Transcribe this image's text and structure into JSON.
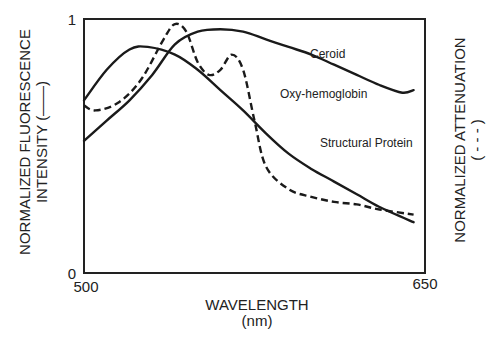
{
  "chart_data": {
    "type": "line",
    "title": "",
    "xlabel": "WAVELENGTH",
    "xlabel_unit": "(nm)",
    "ylabel_left": "NORMALIZED FLUORESCENCE",
    "ylabel_left_line2": "INTENSITY (——)",
    "ylabel_right": "NORMALIZED ATTENUATION",
    "ylabel_right_line2": "( - - - )",
    "xlim": [
      500,
      650
    ],
    "ylim": [
      0,
      1
    ],
    "x_ticks": [
      "500",
      "650"
    ],
    "y_ticks": [
      "0",
      "1"
    ],
    "grid": false,
    "legend": "none (inline labels)",
    "series": [
      {
        "name": "Structural Protein",
        "style": "solid",
        "axis": "left",
        "x": [
          500,
          510,
          520,
          528,
          540,
          550,
          560,
          570,
          580,
          590,
          600,
          610,
          620,
          630,
          645
        ],
        "y": [
          0.68,
          0.8,
          0.88,
          0.89,
          0.86,
          0.8,
          0.72,
          0.64,
          0.55,
          0.47,
          0.41,
          0.36,
          0.31,
          0.26,
          0.2
        ]
      },
      {
        "name": "Ceroid",
        "style": "solid",
        "axis": "left",
        "x": [
          500,
          510,
          520,
          530,
          540,
          550,
          560,
          570,
          580,
          590,
          600,
          610,
          620,
          630,
          640,
          645
        ],
        "y": [
          0.52,
          0.6,
          0.68,
          0.78,
          0.9,
          0.95,
          0.96,
          0.95,
          0.92,
          0.89,
          0.86,
          0.82,
          0.78,
          0.74,
          0.71,
          0.72
        ]
      },
      {
        "name": "Oxy-hemoglobin",
        "style": "dashed",
        "axis": "right",
        "x": [
          500,
          505,
          515,
          525,
          535,
          540,
          545,
          550,
          555,
          560,
          565,
          570,
          575,
          580,
          590,
          600,
          610,
          620,
          630,
          645
        ],
        "y": [
          0.66,
          0.64,
          0.67,
          0.76,
          0.92,
          0.98,
          0.95,
          0.83,
          0.78,
          0.8,
          0.86,
          0.8,
          0.6,
          0.42,
          0.33,
          0.3,
          0.28,
          0.27,
          0.25,
          0.23
        ]
      }
    ],
    "annotations": [
      {
        "text": "Ceroid",
        "x": 595,
        "y": 0.87
      },
      {
        "text": "Oxy-hemoglobin",
        "x": 580,
        "y": 0.71
      },
      {
        "text": "Structural Protein",
        "x": 590,
        "y": 0.52
      }
    ]
  },
  "axes": {
    "x_tick_min": "500",
    "x_tick_max": "650",
    "y_tick_min": "0",
    "y_tick_max": "1",
    "xlabel": "WAVELENGTH",
    "xlabel_unit": "(nm)",
    "ylabel_left": "NORMALIZED FLUORESCENCE",
    "ylabel_left_line2": "INTENSITY (——)",
    "ylabel_right": "NORMALIZED ATTENUATION",
    "ylabel_right_line2": "( - - - )"
  },
  "labels": {
    "ceroid": "Ceroid",
    "oxy": "Oxy-hemoglobin",
    "structural": "Structural Protein"
  }
}
